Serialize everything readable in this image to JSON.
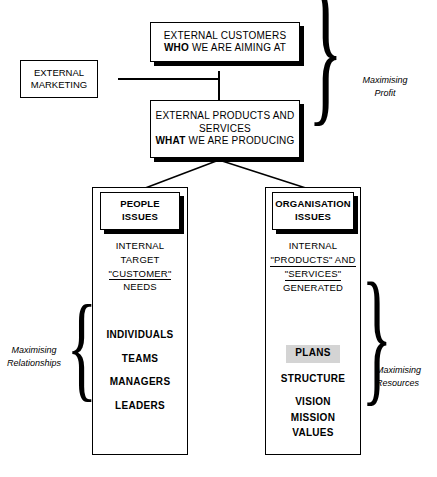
{
  "diagram": {
    "colors": {
      "line": "#000000",
      "background": "#ffffff",
      "highlight": "#d4d4d4"
    },
    "boxes": {
      "external_marketing": {
        "line1": "EXTERNAL",
        "line2": "MARKETING"
      },
      "external_customers": {
        "line1": "EXTERNAL CUSTOMERS",
        "line2_bold": "WHO",
        "line2_rest": " WE ARE AIMING AT"
      },
      "external_products": {
        "line1": "EXTERNAL PRODUCTS AND",
        "line2": "SERVICES",
        "line3_bold": "WHAT",
        "line3_rest": " WE ARE PRODUCING"
      }
    },
    "columns": {
      "left": {
        "header": {
          "line1": "PEOPLE",
          "line2": "ISSUES"
        },
        "description": [
          "INTERNAL",
          "TARGET",
          "\"CUSTOMER\"",
          "NEEDS"
        ],
        "description_underlined_index": 2,
        "items": [
          "INDIVIDUALS",
          "TEAMS",
          "MANAGERS",
          "LEADERS"
        ],
        "highlighted_item_index": -1
      },
      "right": {
        "header": {
          "line1": "ORGANISATION",
          "line2": "ISSUES"
        },
        "description": [
          "INTERNAL",
          "\"PRODUCTS\" AND",
          "\"SERVICES\"",
          "GENERATED"
        ],
        "description_underlined_index": 1,
        "description_underlined_index2": 2,
        "items": [
          "PLANS",
          "STRUCTURE",
          "VISION",
          "MISSION",
          "VALUES"
        ],
        "highlighted_item_index": 0
      }
    },
    "annotations": {
      "top_right": {
        "line1": "Maximising",
        "line2": "Profit"
      },
      "left": {
        "line1": "Maximising",
        "line2": "Relationships"
      },
      "bottom_right": {
        "line1": "Maximising",
        "line2": "Resources"
      }
    },
    "braces": {
      "top_right": "}",
      "left": "{",
      "right": "}"
    }
  }
}
